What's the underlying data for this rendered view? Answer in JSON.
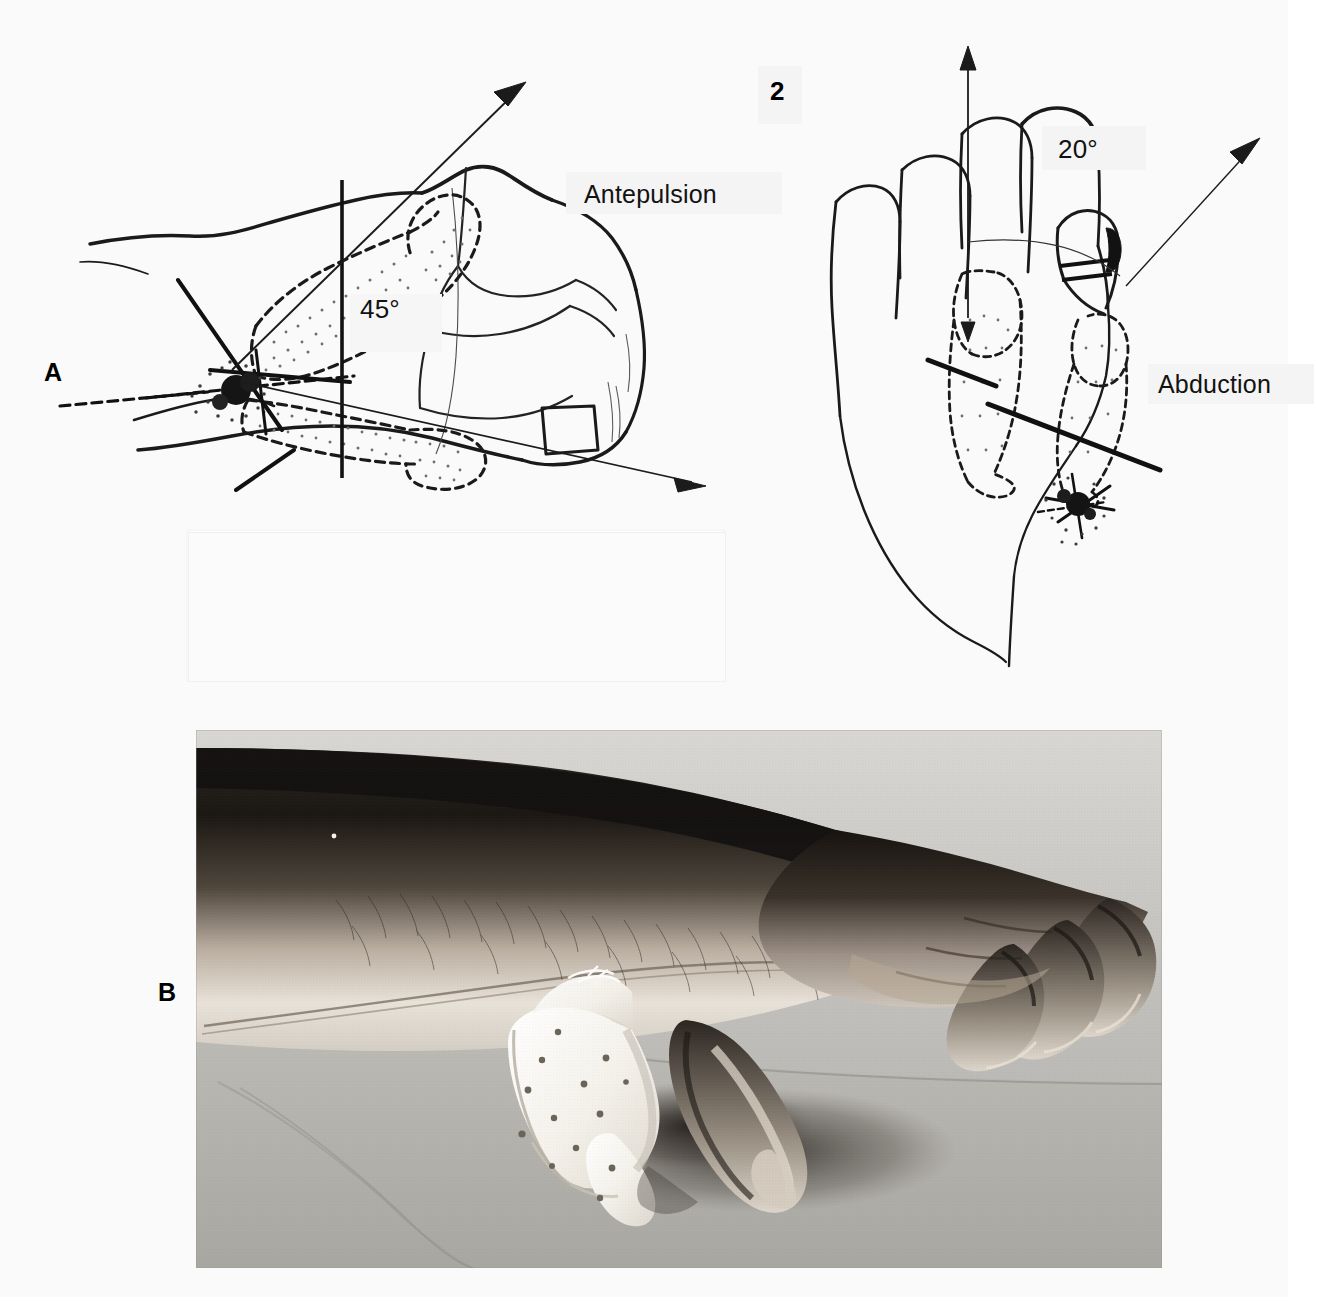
{
  "figure": {
    "number": "2",
    "panels": [
      {
        "letter": "A",
        "type": "line-drawing"
      },
      {
        "letter": "B",
        "type": "photograph"
      }
    ]
  },
  "panel_a": {
    "letter": "A",
    "left_drawing": {
      "view_name": "lateral-view-thumb-antepulsion",
      "angle_label": "45°",
      "motion_label": "Antepulsion",
      "axis_name": "vertical-reference-axis",
      "arrow_names": [
        "antepulsion-arrow-upper",
        "antepulsion-arrow-lower"
      ]
    },
    "right_drawing": {
      "view_name": "dorsal-view-thumb-abduction",
      "angle_label": "20°",
      "motion_label": "Abduction",
      "axis_name": "vertical-reference-axis",
      "arrow_names": [
        "abduction-arrow-vertical",
        "abduction-arrow-oblique"
      ]
    }
  },
  "panel_b": {
    "letter": "B",
    "caption_alt": "photograph-of-forearm-and-hand-with-perforated-thermoplastic-thumb-splint"
  },
  "colors": {
    "page_background": "#fdfdfd",
    "paper_tone": "#fafafa",
    "ink": "#111111",
    "retouch_patch": "#f4f4f4",
    "photo_midtone": "#b9b9b9",
    "photo_shadow": "#1b1b1b",
    "photo_highlight": "#f2f0ec"
  }
}
